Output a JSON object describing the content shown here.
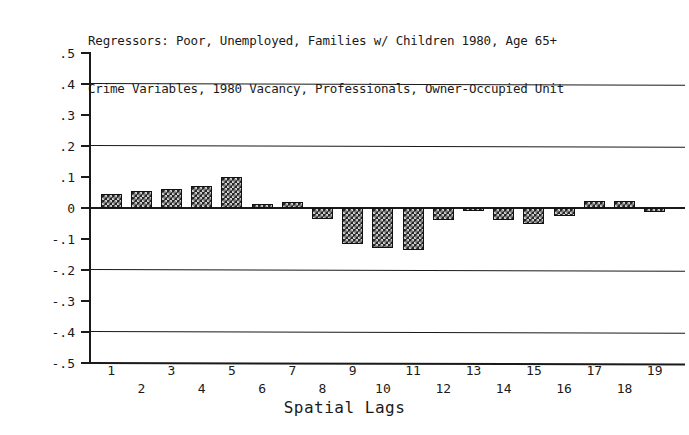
{
  "chart_data": {
    "type": "bar",
    "title": "Regressors: Poor, Unemployed, Families w/ Children 1980, Age 65+\nCrime Variables, 1980 Vacancy, Professionals, Owner-Occupied Unit",
    "title_lines": [
      "Regressors: Poor, Unemployed, Families w/ Children 1980, Age 65+",
      "Crime Variables, 1980 Vacancy, Professionals, Owner-Occupied Unit"
    ],
    "xlabel": "Spatial Lags",
    "ylabel": "",
    "ylim": [
      -0.5,
      0.5
    ],
    "ytick_labels": [
      ".5",
      ".4",
      ".3",
      ".2",
      ".1",
      "0",
      "-.1",
      "-.2",
      "-.3",
      "-.4",
      "-.5"
    ],
    "ytick_values": [
      0.5,
      0.4,
      0.3,
      0.2,
      0.1,
      0,
      -0.1,
      -0.2,
      -0.3,
      -0.4,
      -0.5
    ],
    "gridlines_at": [
      0.4,
      0.2,
      0,
      -0.2,
      -0.4
    ],
    "grid": true,
    "legend": "none",
    "categories": [
      "1",
      "2",
      "3",
      "4",
      "5",
      "6",
      "7",
      "8",
      "9",
      "10",
      "11",
      "12",
      "13",
      "14",
      "15",
      "16",
      "17",
      "18",
      "19"
    ],
    "values": [
      0.045,
      0.055,
      0.06,
      0.07,
      0.1,
      0.012,
      0.02,
      -0.035,
      -0.115,
      -0.13,
      -0.135,
      -0.04,
      -0.008,
      -0.04,
      -0.05,
      -0.025,
      0.022,
      0.022,
      -0.012
    ],
    "series_name": "Spatial autocorrelation coefficient",
    "bar_fill": "#272727",
    "bar_pattern": "checkerboard",
    "axis_color": "#1a1a1a",
    "background": "#ffffff"
  }
}
